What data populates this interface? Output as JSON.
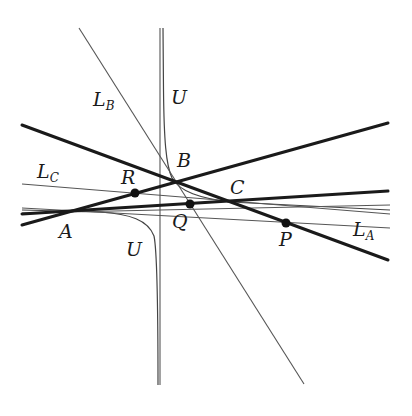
{
  "figure": {
    "type": "geometric-construction",
    "labels": {
      "A": "A",
      "B": "B",
      "C": "C",
      "P": "P",
      "Q": "Q",
      "R": "R",
      "U_top": "U",
      "U_bottom": "U",
      "LA": "L",
      "LA_sub": "A",
      "LB": "L",
      "LB_sub": "B",
      "LC": "L",
      "LC_sub": "C"
    },
    "points": {
      "A": [
        72,
        212
      ],
      "B": [
        176,
        182
      ],
      "C": [
        228,
        200
      ],
      "P": [
        286,
        223
      ],
      "Q": [
        190,
        204
      ],
      "R": [
        135,
        193
      ]
    },
    "lines": [
      {
        "name": "thick-line-AB",
        "x1": 22,
        "y1": 225,
        "x2": 390,
        "y2": 123,
        "weight": "thick"
      },
      {
        "name": "thick-line-BC-P",
        "x1": 22,
        "y1": 125,
        "x2": 390,
        "y2": 260,
        "weight": "thick"
      },
      {
        "name": "thick-line-AC",
        "x1": 22,
        "y1": 212,
        "x2": 390,
        "y2": 191,
        "weight": "thick"
      },
      {
        "name": "line-LA",
        "x1": 22,
        "y1": 208,
        "x2": 390,
        "y2": 228,
        "weight": "thin"
      },
      {
        "name": "line-LB",
        "x1": 79,
        "y1": 28,
        "x2": 304,
        "y2": 384,
        "weight": "thin"
      },
      {
        "name": "line-LC",
        "x1": 22,
        "y1": 184,
        "x2": 390,
        "y2": 214,
        "weight": "thin"
      },
      {
        "name": "line-extra",
        "x1": 22,
        "y1": 213,
        "x2": 390,
        "y2": 205,
        "weight": "thin"
      },
      {
        "name": "vertical-asymptote",
        "x1": 160,
        "y1": 28,
        "x2": 160,
        "y2": 385,
        "weight": "thin"
      }
    ],
    "colors": {
      "stroke": "#1a1a1a",
      "thin": "#555555",
      "background": "#ffffff"
    }
  }
}
